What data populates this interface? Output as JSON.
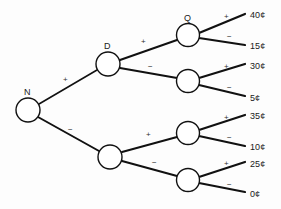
{
  "figure": {
    "type": "decision-tree",
    "background_color": "#fdfdfd",
    "line_color": "#111111",
    "node_fill": "#ffffff",
    "text_color": "#1a1a1a"
  },
  "nodes": [
    {
      "id": "root",
      "label": "N",
      "cx": 28,
      "cy": 110,
      "r": 12,
      "label_x": 24,
      "label_y": 88
    },
    {
      "id": "n-d",
      "label": "D",
      "cx": 108,
      "cy": 64,
      "r": 12,
      "label_x": 104,
      "label_y": 42
    },
    {
      "id": "n-low",
      "label": "",
      "cx": 110,
      "cy": 157,
      "r": 12,
      "label_x": 106,
      "label_y": 135
    },
    {
      "id": "n-q",
      "label": "Q",
      "cx": 188,
      "cy": 35,
      "r": 11.5,
      "label_x": 184,
      "label_y": 14
    },
    {
      "id": "n-dm",
      "label": "",
      "cx": 188,
      "cy": 81,
      "r": 11.5,
      "label_x": 184,
      "label_y": 60
    },
    {
      "id": "n-lp",
      "label": "",
      "cx": 188,
      "cy": 133,
      "r": 11.5,
      "label_x": 184,
      "label_y": 112
    },
    {
      "id": "n-lm",
      "label": "",
      "cx": 188,
      "cy": 180,
      "r": 11.5,
      "label_x": 184,
      "label_y": 159
    }
  ],
  "branch_labels": [
    {
      "id": "root-plus",
      "sign": "+",
      "x": 63,
      "y": 76
    },
    {
      "id": "root-minus",
      "sign": "−",
      "x": 68,
      "y": 126
    },
    {
      "id": "d-plus",
      "sign": "+",
      "x": 141,
      "y": 38
    },
    {
      "id": "d-minus",
      "sign": "−",
      "x": 148,
      "y": 63
    },
    {
      "id": "low-plus",
      "sign": "+",
      "x": 146,
      "y": 131
    },
    {
      "id": "low-minus",
      "sign": "−",
      "x": 152,
      "y": 159
    },
    {
      "id": "q-plus",
      "sign": "+",
      "x": 224,
      "y": 13
    },
    {
      "id": "q-minus",
      "sign": "−",
      "x": 227,
      "y": 33
    },
    {
      "id": "dm-plus",
      "sign": "+",
      "x": 224,
      "y": 63
    },
    {
      "id": "dm-minus",
      "sign": "−",
      "x": 227,
      "y": 84
    },
    {
      "id": "lp-plus",
      "sign": "+",
      "x": 224,
      "y": 114
    },
    {
      "id": "lp-minus",
      "sign": "−",
      "x": 227,
      "y": 134
    },
    {
      "id": "lm-plus",
      "sign": "+",
      "x": 224,
      "y": 160
    },
    {
      "id": "lm-minus",
      "sign": "−",
      "x": 227,
      "y": 181
    }
  ],
  "leaves": [
    {
      "id": "leaf-40",
      "value": "40¢",
      "x": 250,
      "y": 11
    },
    {
      "id": "leaf-15",
      "value": "15¢",
      "x": 250,
      "y": 42
    },
    {
      "id": "leaf-30",
      "value": "30¢",
      "x": 250,
      "y": 62
    },
    {
      "id": "leaf-5",
      "value": "5¢",
      "x": 250,
      "y": 94
    },
    {
      "id": "leaf-35",
      "value": "35¢",
      "x": 250,
      "y": 112
    },
    {
      "id": "leaf-10",
      "value": "10¢",
      "x": 250,
      "y": 143
    },
    {
      "id": "leaf-25",
      "value": "25¢",
      "x": 250,
      "y": 160
    },
    {
      "id": "leaf-0",
      "value": "0¢",
      "x": 250,
      "y": 190
    }
  ],
  "edges": [
    {
      "id": "e-root-d",
      "x1": 39,
      "y1": 104,
      "x2": 97,
      "y2": 70,
      "width": 1.6
    },
    {
      "id": "e-root-low",
      "x1": 38,
      "y1": 117,
      "x2": 99,
      "y2": 151,
      "width": 2.0
    },
    {
      "id": "e-d-q",
      "x1": 120,
      "y1": 60,
      "x2": 177,
      "y2": 40,
      "width": 2.0
    },
    {
      "id": "e-d-dm",
      "x1": 120,
      "y1": 68,
      "x2": 177,
      "y2": 78,
      "width": 2.0
    },
    {
      "id": "e-low-lp",
      "x1": 122,
      "y1": 152,
      "x2": 177,
      "y2": 137,
      "width": 2.0
    },
    {
      "id": "e-low-lm",
      "x1": 122,
      "y1": 161,
      "x2": 177,
      "y2": 176,
      "width": 2.0
    },
    {
      "id": "e-q-40",
      "x1": 199,
      "y1": 33,
      "x2": 245,
      "y2": 14,
      "width": 2.2
    },
    {
      "id": "e-q-15",
      "x1": 199,
      "y1": 38,
      "x2": 245,
      "y2": 45,
      "width": 2.2
    },
    {
      "id": "e-dm-30",
      "x1": 199,
      "y1": 78,
      "x2": 245,
      "y2": 64,
      "width": 2.2
    },
    {
      "id": "e-dm-5",
      "x1": 199,
      "y1": 85,
      "x2": 245,
      "y2": 96,
      "width": 2.2
    },
    {
      "id": "e-lp-35",
      "x1": 199,
      "y1": 130,
      "x2": 245,
      "y2": 115,
      "width": 2.2
    },
    {
      "id": "e-lp-10",
      "x1": 199,
      "y1": 136,
      "x2": 245,
      "y2": 146,
      "width": 2.2
    },
    {
      "id": "e-lm-25",
      "x1": 199,
      "y1": 177,
      "x2": 245,
      "y2": 162,
      "width": 2.2
    },
    {
      "id": "e-lm-0",
      "x1": 199,
      "y1": 183,
      "x2": 245,
      "y2": 192,
      "width": 2.2
    }
  ]
}
